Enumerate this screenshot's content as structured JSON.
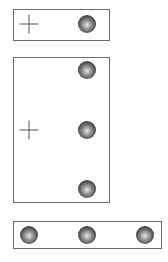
{
  "panels": [
    {
      "name": "panel-single",
      "rect": {
        "x": 13,
        "y": 9,
        "w": 97,
        "h": 32
      },
      "crosshair": {
        "x": 29,
        "y": 24
      },
      "balls": [
        {
          "x": 87,
          "y": 24
        }
      ]
    },
    {
      "name": "panel-column",
      "rect": {
        "x": 13,
        "y": 57,
        "w": 97,
        "h": 146
      },
      "crosshair": {
        "x": 29,
        "y": 130
      },
      "balls": [
        {
          "x": 87,
          "y": 70
        },
        {
          "x": 87,
          "y": 130
        },
        {
          "x": 87,
          "y": 189
        }
      ]
    },
    {
      "name": "panel-row",
      "rect": {
        "x": 13,
        "y": 221,
        "w": 149,
        "h": 28
      },
      "crosshair": null,
      "balls": [
        {
          "x": 29,
          "y": 235
        },
        {
          "x": 87,
          "y": 235
        },
        {
          "x": 145,
          "y": 235
        }
      ]
    }
  ],
  "colors": {
    "border": "#6a6a6a",
    "ball_dark": "#1e1e1e",
    "ball_highlight": "#e8e8e8",
    "crosshair": "#555555"
  }
}
